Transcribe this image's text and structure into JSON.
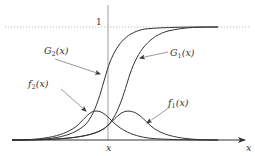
{
  "diagram": {
    "title": "",
    "y_axis_level_label": "1",
    "x_axis_label": "x",
    "x_tick_label": "x",
    "curves": [
      {
        "name": "G2",
        "label_main": "G",
        "label_sub": "2",
        "label_arg": "(x)",
        "type": "cdf",
        "center": 108
      },
      {
        "name": "G1",
        "label_main": "G",
        "label_sub": "1",
        "label_arg": "(x)",
        "type": "cdf",
        "center": 128
      },
      {
        "name": "f2",
        "label_main": "f",
        "label_sub": "2",
        "label_arg": "(x)",
        "type": "pdf",
        "center": 95
      },
      {
        "name": "f1",
        "label_main": "f",
        "label_sub": "1",
        "label_arg": "(x)",
        "type": "pdf",
        "center": 128
      }
    ],
    "colors": {
      "curve": "#333333",
      "axis": "#555555",
      "dotted": "#bbbbbb"
    }
  }
}
